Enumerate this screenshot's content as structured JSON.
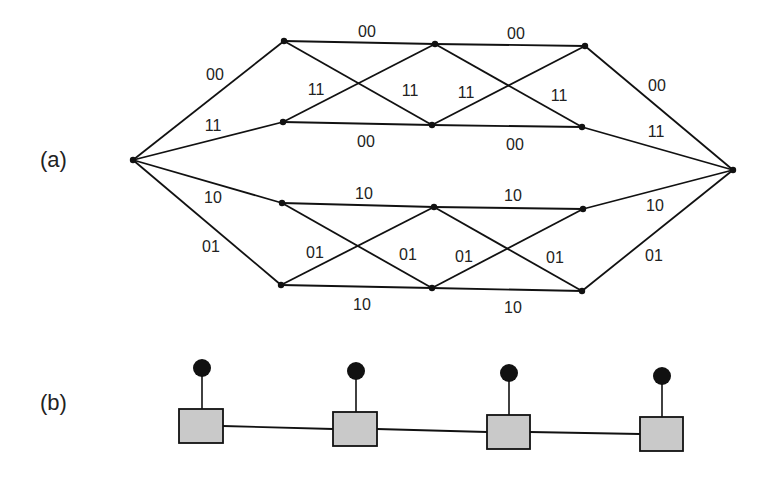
{
  "panels": {
    "a": {
      "label": "(a)"
    },
    "b": {
      "label": "(b)"
    }
  },
  "trellis": {
    "source": {
      "x": 133,
      "y": 160
    },
    "sink": {
      "x": 733,
      "y": 170
    },
    "nodes": [
      [
        {
          "x": 284,
          "y": 41
        },
        {
          "x": 435,
          "y": 44
        },
        {
          "x": 585,
          "y": 46
        }
      ],
      [
        {
          "x": 283,
          "y": 122
        },
        {
          "x": 432,
          "y": 125
        },
        {
          "x": 582,
          "y": 127
        }
      ],
      [
        {
          "x": 282,
          "y": 203
        },
        {
          "x": 434,
          "y": 207
        },
        {
          "x": 583,
          "y": 209
        }
      ],
      [
        {
          "x": 281,
          "y": 285
        },
        {
          "x": 432,
          "y": 288
        },
        {
          "x": 582,
          "y": 291
        }
      ]
    ],
    "edge_labels": [
      {
        "text": "00",
        "x": 215,
        "y": 80
      },
      {
        "text": "11",
        "x": 213,
        "y": 131
      },
      {
        "text": "10",
        "x": 213,
        "y": 203
      },
      {
        "text": "01",
        "x": 211,
        "y": 252
      },
      {
        "text": "00",
        "x": 367,
        "y": 37
      },
      {
        "text": "11",
        "x": 316,
        "y": 95
      },
      {
        "text": "11",
        "x": 410,
        "y": 96
      },
      {
        "text": "00",
        "x": 366,
        "y": 147
      },
      {
        "text": "00",
        "x": 516,
        "y": 39
      },
      {
        "text": "11",
        "x": 466,
        "y": 98
      },
      {
        "text": "11",
        "x": 559,
        "y": 101
      },
      {
        "text": "00",
        "x": 515,
        "y": 150
      },
      {
        "text": "00",
        "x": 657,
        "y": 91
      },
      {
        "text": "11",
        "x": 656,
        "y": 137
      },
      {
        "text": "10",
        "x": 364,
        "y": 199
      },
      {
        "text": "01",
        "x": 315,
        "y": 258
      },
      {
        "text": "01",
        "x": 408,
        "y": 260
      },
      {
        "text": "10",
        "x": 362,
        "y": 310
      },
      {
        "text": "10",
        "x": 513,
        "y": 201
      },
      {
        "text": "01",
        "x": 464,
        "y": 262
      },
      {
        "text": "01",
        "x": 555,
        "y": 263
      },
      {
        "text": "10",
        "x": 513,
        "y": 313
      },
      {
        "text": "10",
        "x": 655,
        "y": 211
      },
      {
        "text": "01",
        "x": 654,
        "y": 261
      }
    ]
  },
  "chain": {
    "boxes": [
      {
        "x": 179,
        "y": 409,
        "w": 44,
        "h": 34,
        "cx": 202,
        "cy": 368
      },
      {
        "x": 333,
        "y": 412,
        "w": 44,
        "h": 34,
        "cx": 356,
        "cy": 371
      },
      {
        "x": 487,
        "y": 415,
        "w": 43,
        "h": 34,
        "cx": 509,
        "cy": 373
      },
      {
        "x": 640,
        "y": 417,
        "w": 43,
        "h": 34,
        "cx": 662,
        "cy": 376
      }
    ],
    "circle_radius": 9,
    "fill_color": "#c9c9c9"
  }
}
